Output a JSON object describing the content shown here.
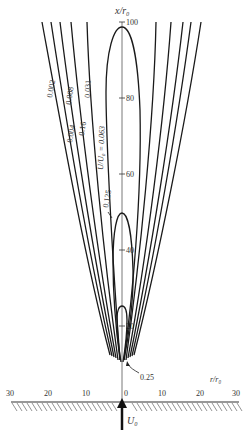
{
  "figure": {
    "type": "contour-diagram",
    "y_axis": {
      "label": "x/r₀",
      "ticks": [
        {
          "value": 20,
          "label": "20"
        },
        {
          "value": 40,
          "label": "40"
        },
        {
          "value": 60,
          "label": "60"
        },
        {
          "value": 80,
          "label": "80"
        },
        {
          "value": 100,
          "label": "100"
        }
      ]
    },
    "x_axis": {
      "label": "r/r₀",
      "ticks": [
        {
          "value": -30,
          "label": "30"
        },
        {
          "value": -20,
          "label": "20"
        },
        {
          "value": -10,
          "label": "10"
        },
        {
          "value": 0,
          "label": "0"
        },
        {
          "value": 10,
          "label": "10"
        },
        {
          "value": 20,
          "label": "20"
        },
        {
          "value": 30,
          "label": "30"
        }
      ]
    },
    "inlet_label": "U₀",
    "contour_title": "U/U₀ = 0.063",
    "contour_labels": [
      {
        "value": "0.002"
      },
      {
        "value": "0.004"
      },
      {
        "value": "0.008"
      },
      {
        "value": "0.16"
      },
      {
        "value": "0.031"
      },
      {
        "value": "0.063"
      },
      {
        "value": "0.125"
      },
      {
        "value": "0.25"
      }
    ],
    "labels": {
      "c0002": "0.002",
      "c0004": "0.004",
      "c0008": "0.008",
      "c016": "0.16",
      "c0031": "0.031",
      "c0125": "0.125",
      "c025": "0.25",
      "closed_label": "U/U₀ = 0.063",
      "y_axis_label": "x/r₀",
      "x_axis_label": "r/r₀",
      "inlet": "U₀",
      "t100": "100",
      "t80": "80",
      "t60": "60",
      "t40": "40",
      "t20": "20",
      "xl30": "30",
      "xl20": "20",
      "xl10": "10",
      "x0": "0",
      "xr10": "10",
      "xr20": "20",
      "xr30": "30"
    }
  }
}
